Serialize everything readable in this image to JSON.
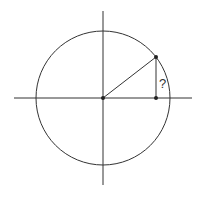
{
  "diagram": {
    "title": "",
    "type": "unit-circle",
    "center": {
      "x": 103,
      "y": 98
    },
    "radius": 67,
    "point": {
      "x": 156,
      "y": 57
    },
    "foot": {
      "x": 156,
      "y": 98
    },
    "unknown_label": "?",
    "colors": {
      "stroke": "#333333",
      "background": "#ffffff"
    }
  }
}
